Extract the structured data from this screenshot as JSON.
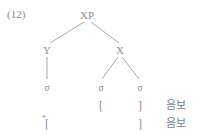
{
  "figure": {
    "example_number": "(12)",
    "line_color": "#a8a8a8",
    "text_color": "#8c8c8c"
  },
  "tree": {
    "nodes": {
      "root": "XP",
      "left_child": "Y",
      "right_child": "X"
    },
    "leaves": {
      "leaf_1": "σ",
      "leaf_2": "σ",
      "leaf_3": "σ"
    },
    "edges": [
      {
        "from": "XP",
        "to": "Y"
      },
      {
        "from": "XP",
        "to": "X"
      },
      {
        "from": "Y",
        "to": "leaf_1"
      },
      {
        "from": "X",
        "to": "leaf_2"
      },
      {
        "from": "X",
        "to": "leaf_3"
      }
    ]
  },
  "annotations": {
    "row1": {
      "open_bracket": "[",
      "close_bracket": "]",
      "gloss": "음보"
    },
    "row2": {
      "star": "*",
      "open_bracket": "[",
      "close_bracket": "]",
      "gloss": "음보"
    }
  }
}
